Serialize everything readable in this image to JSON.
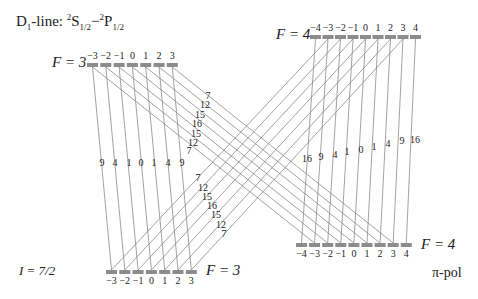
{
  "title": {
    "prefix": "D",
    "prefix_sub": "1",
    "text": "-line: ",
    "s_sup": "2",
    "s_main": "S",
    "s_sub": "1/2",
    "dash": "−",
    "p_sup": "2",
    "p_main": "P",
    "p_sub": "1/2"
  },
  "nuclear_spin": "I = 7/2",
  "polarization": "π-pol",
  "colors": {
    "line": "#8a8a8a",
    "bar": "#8c8c8c",
    "text": "#222222"
  },
  "levels": {
    "top_f3": {
      "label": "F = 3",
      "m": [
        "−3",
        "−2",
        "−1",
        "0",
        "1",
        "2",
        "3"
      ],
      "x0": 87,
      "pitch": 13.3,
      "y": 63
    },
    "top_f4": {
      "label": "F = 4",
      "m": [
        "−4",
        "−3",
        "−2",
        "−1",
        "0",
        "1",
        "2",
        "3",
        "4"
      ],
      "x0": 310,
      "pitch": 12.5,
      "y": 35
    },
    "bottom_f4": {
      "label": "F = 4",
      "m": [
        "−4",
        "−3",
        "−2",
        "−1",
        "0",
        "1",
        "2",
        "3",
        "4"
      ],
      "x0": 296,
      "pitch": 13.1,
      "y": 243
    },
    "bottom_f3": {
      "label": "F = 3",
      "m": [
        "−3",
        "−2",
        "−1",
        "0",
        "1",
        "2",
        "3"
      ],
      "x0": 106,
      "pitch": 13.3,
      "y": 270
    }
  },
  "transitions": {
    "f3_to_f3": {
      "strengths": [
        "9",
        "4",
        "1",
        "0",
        "1",
        "4",
        "9"
      ]
    },
    "f3_to_f4": {
      "strengths": [
        "7",
        "12",
        "15",
        "16",
        "15",
        "12",
        "7"
      ]
    },
    "f4_to_f3": {
      "strengths": [
        "7",
        "12",
        "15",
        "16",
        "15",
        "12",
        "7"
      ]
    },
    "f4_to_f4": {
      "strengths": [
        "16",
        "9",
        "4",
        "1",
        "0",
        "1",
        "4",
        "9",
        "16"
      ]
    }
  }
}
